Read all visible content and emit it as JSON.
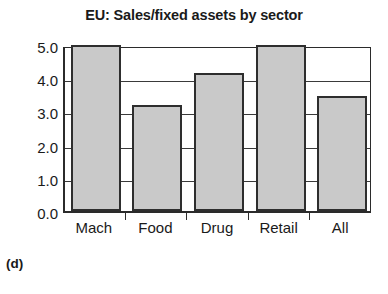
{
  "figure": {
    "caption": "(d)",
    "background_color": "#ffffff"
  },
  "chart_data": {
    "type": "bar",
    "title": "EU: Sales/fixed assets by sector",
    "xlabel": "",
    "ylabel": "",
    "categories": [
      "Mach",
      "Food",
      "Drug",
      "Retail",
      "All"
    ],
    "values": [
      5.0,
      3.2,
      4.15,
      5.0,
      3.45
    ],
    "value_notes": [
      "clipped at axis maximum",
      "",
      "",
      "clipped at axis maximum",
      ""
    ],
    "ylim": [
      0.0,
      5.0
    ],
    "ytick_labels": [
      "0.0",
      "1.0",
      "2.0",
      "3.0",
      "4.0",
      "5.0"
    ],
    "ytick_values": [
      0.0,
      1.0,
      2.0,
      3.0,
      4.0,
      5.0
    ],
    "grid": true,
    "grid_axis": "y",
    "legend": false,
    "bar_fill_color": "#c9c9c9",
    "bar_edge_color": "#2e2e2e",
    "axis_color": "#2b2b2b"
  }
}
